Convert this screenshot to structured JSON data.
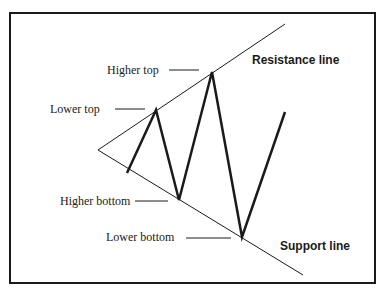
{
  "diagram": {
    "type": "symmetrical triangle / broadening formation chart pattern",
    "lines": {
      "resistance": {
        "label": "Resistance line"
      },
      "support": {
        "label": "Support line"
      }
    },
    "annotations": [
      {
        "id": "higher-top",
        "label": "Higher top"
      },
      {
        "id": "lower-top",
        "label": "Lower top"
      },
      {
        "id": "higher-bottom",
        "label": "Higher bottom"
      },
      {
        "id": "lower-bottom",
        "label": "Lower bottom"
      }
    ],
    "colors": {
      "line": "#1a1a1a",
      "background": "#ffffff"
    }
  }
}
